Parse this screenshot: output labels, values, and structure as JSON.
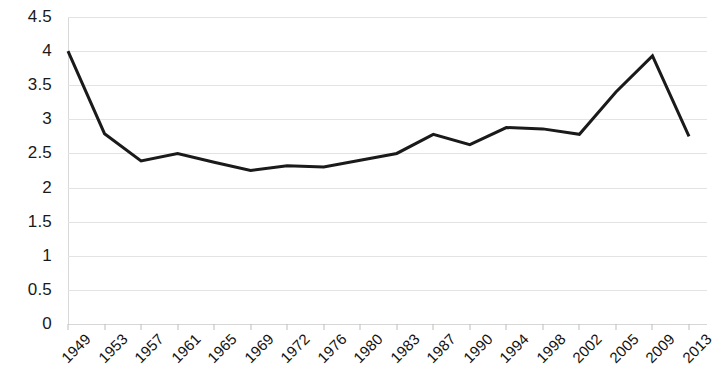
{
  "chart_data": {
    "type": "line",
    "title": "",
    "subtitle": "",
    "xlabel": "",
    "ylabel": "",
    "legend": [],
    "legend_position": "none",
    "grid": true,
    "grid_axis": "y",
    "line_color": "#1a1a1a",
    "line_width": 3,
    "background_color": "#ffffff",
    "gridline_color": "#e3e3e3",
    "ylim": [
      0,
      4.5
    ],
    "ytick_step": 0.5,
    "ytick_labels": [
      "0",
      "0.5",
      "1",
      "1.5",
      "2",
      "2.5",
      "3",
      "3.5",
      "4",
      "4.5"
    ],
    "ytick_values": [
      0,
      0.5,
      1,
      1.5,
      2,
      2.5,
      3,
      3.5,
      4,
      4.5
    ],
    "categories": [
      "1949",
      "1953",
      "1957",
      "1961",
      "1965",
      "1969",
      "1972",
      "1976",
      "1980",
      "1983",
      "1987",
      "1990",
      "1994",
      "1998",
      "2002",
      "2005",
      "2009",
      "2013"
    ],
    "values": [
      4.0,
      2.79,
      2.39,
      2.5,
      2.37,
      2.25,
      2.32,
      2.3,
      2.4,
      2.5,
      2.78,
      2.63,
      2.88,
      2.86,
      2.78,
      3.4,
      3.93,
      2.75
    ],
    "series": [
      {
        "name": "series-1",
        "values": [
          4.0,
          2.79,
          2.39,
          2.5,
          2.37,
          2.25,
          2.32,
          2.3,
          2.4,
          2.5,
          2.78,
          2.63,
          2.88,
          2.86,
          2.78,
          3.4,
          3.93,
          2.75
        ]
      }
    ]
  }
}
